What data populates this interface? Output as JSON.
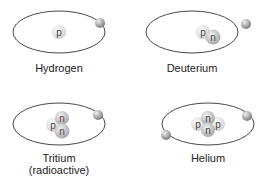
{
  "atoms": [
    {
      "name": "Hydrogen",
      "label": "Hydrogen",
      "sublabel": "",
      "nucleus": [
        "p"
      ],
      "electrons": 1
    },
    {
      "name": "Deuterium",
      "label": "Deuterium",
      "sublabel": "",
      "nucleus": [
        "p",
        "n"
      ],
      "electrons": 1
    },
    {
      "name": "Tritium",
      "label": "Tritium",
      "sublabel": "(radioactive)",
      "nucleus": [
        "p",
        "n",
        "n"
      ],
      "electrons": 1
    },
    {
      "name": "Helium",
      "label": "Helium",
      "sublabel": "",
      "nucleus": [
        "p",
        "n",
        "n",
        "p"
      ],
      "electrons": 2
    }
  ],
  "colors": {
    "orbit": "#333333",
    "proton": "#e0e0e0",
    "neutron": "#c8c8c8",
    "electron": "#9a9a9a",
    "text": "#222222"
  }
}
